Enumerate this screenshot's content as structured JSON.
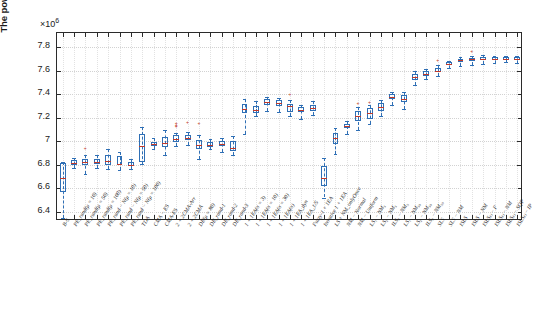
{
  "chart_data": {
    "type": "box",
    "title": "",
    "xlabel": "",
    "ylabel": "The power output of array (Watt)",
    "y_exponent_label": "×10",
    "y_exponent_value": "6",
    "ylim": [
      6.32,
      7.92
    ],
    "yticks": [
      6.4,
      6.6,
      6.8,
      7.0,
      7.2,
      7.4,
      7.6,
      7.8
    ],
    "ytick_labels": [
      "6.4",
      "6.6",
      "6.8",
      "7",
      "7.2",
      "7.4",
      "7.6",
      "7.8"
    ],
    "grid": true,
    "legend": "none",
    "units": "1e6 Watt",
    "categories": [
      "B-S",
      "PE_rand(μ = 10)",
      "PE_rand(μ = 50)",
      "PE_rand(μ = 100)",
      "PE_rand − N(μ = 10)",
      "PE_rand − N(μ = 50)",
      "PE_rand − N(μ = 100)",
      "TDA",
      "CMA − ES",
      "CMA-ES",
      "2 + 2CMA-Arr",
      "2 + 2CMA",
      "DE(μ = 80)",
      "DE_rand-1",
      "DE_rand-2",
      "DE_rand-3",
      "1 + 1EA(σ = 3)",
      "1 + 1EA(σ = 10)",
      "1 + 1EA(σ = 30)",
      "1 + 1EA(σ)",
      "1 + 1EA_dyn",
      "1 + 1EA_1/5",
      "Fuzzy-1 + 1EA",
      "Iterative 1 + 1EA",
      "LS + NM_onlyOnce",
      "NM − Normal",
      "NM − Uniform",
      "LS₁ − NM₅",
      "LS₂ − NM₅",
      "ILS₂ − NM₅",
      "LS₁ − NM₅₀",
      "LS₂ − NM₅₀",
      "ILS₂ − NM₅₀",
      "SLS",
      "SLS − NM",
      "ISLS",
      "ISLS − NM",
      "ISLS₍ᵢ₎ − F",
      "ISLS₍ᵢ₎ − NM",
      "ISLS₍ᵢ₎ − SQP",
      "ISLS₍ᵢ₎ − IP"
    ],
    "boxes": [
      {
        "label": "B-S",
        "whisker_low": 6.345,
        "q1": 6.565,
        "median": 6.685,
        "q3": 6.815,
        "whisker_high": 6.825,
        "outliers": []
      },
      {
        "label": "PE_rand(mu=10)",
        "whisker_low": 6.775,
        "q1": 6.8,
        "median": 6.812,
        "q3": 6.84,
        "whisker_high": 6.86,
        "outliers": []
      },
      {
        "label": "PE_rand(mu=50)",
        "whisker_low": 6.72,
        "q1": 6.795,
        "median": 6.818,
        "q3": 6.85,
        "whisker_high": 6.88,
        "outliers": [
          6.935
        ]
      },
      {
        "label": "PE_rand(mu=100)",
        "whisker_low": 6.775,
        "q1": 6.805,
        "median": 6.825,
        "q3": 6.845,
        "whisker_high": 6.88,
        "outliers": []
      },
      {
        "label": "PE_rand-N(mu=10)",
        "whisker_low": 6.76,
        "q1": 6.8,
        "median": 6.83,
        "q3": 6.88,
        "whisker_high": 6.93,
        "outliers": []
      },
      {
        "label": "PE_rand-N(mu=50)",
        "whisker_low": 6.75,
        "q1": 6.795,
        "median": 6.805,
        "q3": 6.875,
        "whisker_high": 6.905,
        "outliers": []
      },
      {
        "label": "PE_rand-N(mu=100)",
        "whisker_low": 6.76,
        "q1": 6.79,
        "median": 6.8,
        "q3": 6.82,
        "whisker_high": 6.85,
        "outliers": []
      },
      {
        "label": "TDA",
        "whisker_low": 6.805,
        "q1": 6.82,
        "median": 6.96,
        "q3": 7.06,
        "whisker_high": 7.12,
        "outliers": []
      },
      {
        "label": "CMA-ES",
        "whisker_low": 6.93,
        "q1": 6.955,
        "median": 6.975,
        "q3": 6.99,
        "whisker_high": 7.03,
        "outliers": []
      },
      {
        "label": "CMA-ES2",
        "whisker_low": 6.88,
        "q1": 6.95,
        "median": 6.985,
        "q3": 7.035,
        "whisker_high": 7.095,
        "outliers": []
      },
      {
        "label": "2+2CMA-Arr",
        "whisker_low": 6.96,
        "q1": 6.99,
        "median": 7.02,
        "q3": 7.05,
        "whisker_high": 7.07,
        "outliers": [
          7.125,
          7.135,
          7.15
        ]
      },
      {
        "label": "2+2CMA",
        "whisker_low": 6.97,
        "q1": 7.01,
        "median": 7.03,
        "q3": 7.055,
        "whisker_high": 7.075,
        "outliers": [
          7.16
        ]
      },
      {
        "label": "DE(mu=80)",
        "whisker_low": 6.845,
        "q1": 6.93,
        "median": 6.965,
        "q3": 7.01,
        "whisker_high": 7.055,
        "outliers": [
          7.15
        ]
      },
      {
        "label": "DE_rand-1",
        "whisker_low": 6.93,
        "q1": 6.95,
        "median": 6.965,
        "q3": 6.995,
        "whisker_high": 7.02,
        "outliers": []
      },
      {
        "label": "DE_rand-2",
        "whisker_low": 6.905,
        "q1": 6.955,
        "median": 6.975,
        "q3": 7.0,
        "whisker_high": 7.025,
        "outliers": []
      },
      {
        "label": "DE_rand-3",
        "whisker_low": 6.885,
        "q1": 6.915,
        "median": 6.94,
        "q3": 7.0,
        "whisker_high": 7.04,
        "outliers": []
      },
      {
        "label": "1+1EA(s=3)",
        "whisker_low": 7.06,
        "q1": 7.235,
        "median": 7.27,
        "q3": 7.32,
        "whisker_high": 7.355,
        "outliers": []
      },
      {
        "label": "1+1EA(s=10)",
        "whisker_low": 7.21,
        "q1": 7.24,
        "median": 7.265,
        "q3": 7.3,
        "whisker_high": 7.34,
        "outliers": []
      },
      {
        "label": "1+1EA(s=30)",
        "whisker_low": 7.255,
        "q1": 7.31,
        "median": 7.33,
        "q3": 7.355,
        "whisker_high": 7.375,
        "outliers": []
      },
      {
        "label": "1+1EA(s)",
        "whisker_low": 7.25,
        "q1": 7.3,
        "median": 7.325,
        "q3": 7.35,
        "whisker_high": 7.37,
        "outliers": []
      },
      {
        "label": "1+1EA_dyn",
        "whisker_low": 7.215,
        "q1": 7.25,
        "median": 7.3,
        "q3": 7.32,
        "whisker_high": 7.35,
        "outliers": [
          7.395
        ]
      },
      {
        "label": "1+1EA_1/5",
        "whisker_low": 7.19,
        "q1": 7.245,
        "median": 7.265,
        "q3": 7.29,
        "whisker_high": 7.31,
        "outliers": []
      },
      {
        "label": "Fuzzy-1+1EA",
        "whisker_low": 7.225,
        "q1": 7.26,
        "median": 7.285,
        "q3": 7.31,
        "whisker_high": 7.34,
        "outliers": []
      },
      {
        "label": "Iterative 1+1EA",
        "whisker_low": 6.52,
        "q1": 6.62,
        "median": 6.69,
        "q3": 6.79,
        "whisker_high": 6.86,
        "outliers": []
      },
      {
        "label": "LS+NM_onlyOnce",
        "whisker_low": 6.89,
        "q1": 6.975,
        "median": 7.03,
        "q3": 7.065,
        "whisker_high": 7.115,
        "outliers": []
      },
      {
        "label": "NM-Normal",
        "whisker_low": 7.06,
        "q1": 7.115,
        "median": 7.13,
        "q3": 7.145,
        "whisker_high": 7.175,
        "outliers": []
      },
      {
        "label": "NM-Uniform",
        "whisker_low": 7.095,
        "q1": 7.175,
        "median": 7.215,
        "q3": 7.26,
        "whisker_high": 7.29,
        "outliers": [
          7.32
        ]
      },
      {
        "label": "LS1-NM5",
        "whisker_low": 7.145,
        "q1": 7.185,
        "median": 7.235,
        "q3": 7.28,
        "whisker_high": 7.305,
        "outliers": [
          7.33
        ]
      },
      {
        "label": "LS2-NM5",
        "whisker_low": 7.215,
        "q1": 7.255,
        "median": 7.29,
        "q3": 7.325,
        "whisker_high": 7.35,
        "outliers": []
      },
      {
        "label": "ILS2-NM5",
        "whisker_low": 7.31,
        "q1": 7.355,
        "median": 7.375,
        "q3": 7.4,
        "whisker_high": 7.42,
        "outliers": []
      },
      {
        "label": "LS1-NM50",
        "whisker_low": 7.275,
        "q1": 7.335,
        "median": 7.36,
        "q3": 7.395,
        "whisker_high": 7.42,
        "outliers": []
      },
      {
        "label": "LS2-NM50",
        "whisker_low": 7.48,
        "q1": 7.52,
        "median": 7.545,
        "q3": 7.57,
        "whisker_high": 7.6,
        "outliers": []
      },
      {
        "label": "ILS2-NM50",
        "whisker_low": 7.53,
        "q1": 7.555,
        "median": 7.575,
        "q3": 7.595,
        "whisker_high": 7.615,
        "outliers": []
      },
      {
        "label": "SLS",
        "whisker_low": 7.555,
        "q1": 7.59,
        "median": 7.6,
        "q3": 7.62,
        "whisker_high": 7.645,
        "outliers": [
          7.69
        ]
      },
      {
        "label": "SLS-NM",
        "whisker_low": 7.625,
        "q1": 7.65,
        "median": 7.66,
        "q3": 7.67,
        "whisker_high": 7.685,
        "outliers": []
      },
      {
        "label": "ISLS",
        "whisker_low": 7.64,
        "q1": 7.675,
        "median": 7.69,
        "q3": 7.7,
        "whisker_high": 7.715,
        "outliers": []
      },
      {
        "label": "ISLS-NM",
        "whisker_low": 7.65,
        "q1": 7.68,
        "median": 7.695,
        "q3": 7.71,
        "whisker_high": 7.725,
        "outliers": [
          7.76
        ]
      },
      {
        "label": "ISLS_i-F",
        "whisker_low": 7.66,
        "q1": 7.69,
        "median": 7.7,
        "q3": 7.715,
        "whisker_high": 7.73,
        "outliers": []
      },
      {
        "label": "ISLS_i-NM",
        "whisker_low": 7.665,
        "q1": 7.69,
        "median": 7.7,
        "q3": 7.712,
        "whisker_high": 7.725,
        "outliers": []
      },
      {
        "label": "ISLS_i-SQP",
        "whisker_low": 7.67,
        "q1": 7.692,
        "median": 7.702,
        "q3": 7.714,
        "whisker_high": 7.728,
        "outliers": []
      },
      {
        "label": "ISLS_i-IP",
        "whisker_low": 7.668,
        "q1": 7.69,
        "median": 7.7,
        "q3": 7.713,
        "whisker_high": 7.727,
        "outliers": []
      }
    ]
  },
  "colors": {
    "box_edge": "#2f6fb5",
    "median": "#c0392b",
    "outlier": "#c0392b",
    "axis": "#2b2b2b",
    "grid": "#d2d2d2",
    "background": "#ffffff"
  }
}
